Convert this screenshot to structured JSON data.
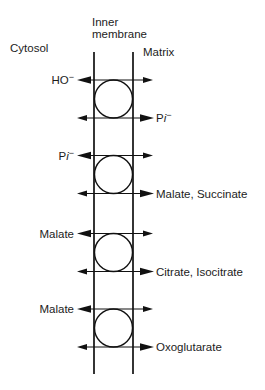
{
  "diagram": {
    "compartments": {
      "cytosol": "Cytosol",
      "inner_membrane_line1": "Inner",
      "inner_membrane_line2": "membrane",
      "matrix": "Matrix"
    },
    "transporters": [
      {
        "to_cytosol": [
          {
            "text": "HO"
          },
          {
            "text": "−",
            "superscript": true
          }
        ],
        "to_matrix": [
          {
            "text": "P"
          },
          {
            "text": "i",
            "italic": true
          },
          {
            "text": "−",
            "superscript": true
          }
        ]
      },
      {
        "to_cytosol": [
          {
            "text": "P"
          },
          {
            "text": "i",
            "italic": true
          },
          {
            "text": "−",
            "superscript": true
          }
        ],
        "to_matrix": [
          {
            "text": "Malate, Succinate"
          }
        ]
      },
      {
        "to_cytosol": [
          {
            "text": "Malate"
          }
        ],
        "to_matrix": [
          {
            "text": "Citrate, Isocitrate"
          }
        ]
      },
      {
        "to_cytosol": [
          {
            "text": "Malate"
          }
        ],
        "to_matrix": [
          {
            "text": "Oxoglutarate"
          }
        ]
      }
    ]
  }
}
